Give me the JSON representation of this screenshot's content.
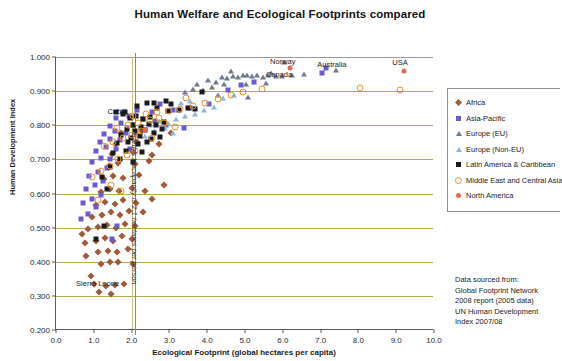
{
  "chart_data": {
    "type": "scatter",
    "title": "Human Welfare and Ecological Footprints compared",
    "xlabel": "Ecological Footprint (global hectares per capita)",
    "ylabel": "Human Development Index",
    "xlim": [
      0.0,
      10.0
    ],
    "ylim": [
      0.2,
      1.0
    ],
    "xticks": [
      "0.0",
      "1.0",
      "2.0",
      "3.0",
      "4.0",
      "5.0",
      "6.0",
      "7.0",
      "8.0",
      "9.0",
      "10.0"
    ],
    "yticks": [
      "0.200",
      "0.300",
      "0.400",
      "0.500",
      "0.600",
      "0.700",
      "0.800",
      "0.900",
      "1.000"
    ],
    "grid": "horizontal",
    "legend_position": "right",
    "annotations": [
      {
        "text": "Cuba",
        "x": 1.6,
        "y": 0.838
      },
      {
        "text": "Norway",
        "x": 6.0,
        "y": 0.985
      },
      {
        "text": "Canada",
        "x": 5.9,
        "y": 0.948
      },
      {
        "text": "Australia",
        "x": 7.3,
        "y": 0.977
      },
      {
        "text": "USA",
        "x": 9.1,
        "y": 0.982
      },
      {
        "text": "Sierra Leone",
        "x": 1.1,
        "y": 0.335
      },
      {
        "text": "Earth's biocapacity is 2.1 hectares per person",
        "x": 2.1,
        "y": 0.77,
        "rotated": true
      }
    ],
    "reference_lines": [
      {
        "axis": "x",
        "value": 2.1,
        "color": "#e06666",
        "label": "Earth's biocapacity is 2.1 hectares per person"
      }
    ],
    "series": [
      {
        "name": "Africa",
        "marker": "diamond",
        "color": "#9e5b3a",
        "points": [
          [
            1.0,
            0.336
          ],
          [
            1.32,
            0.33
          ],
          [
            1.55,
            0.332
          ],
          [
            1.8,
            0.334
          ],
          [
            0.92,
            0.358
          ],
          [
            1.2,
            0.392
          ],
          [
            1.42,
            0.398
          ],
          [
            1.65,
            0.4
          ],
          [
            2.05,
            0.392
          ],
          [
            0.8,
            0.418
          ],
          [
            1.1,
            0.43
          ],
          [
            1.38,
            0.432
          ],
          [
            1.62,
            0.428
          ],
          [
            1.9,
            0.436
          ],
          [
            0.78,
            0.455
          ],
          [
            1.05,
            0.462
          ],
          [
            1.3,
            0.47
          ],
          [
            1.52,
            0.462
          ],
          [
            1.75,
            0.474
          ],
          [
            2.0,
            0.466
          ],
          [
            0.85,
            0.495
          ],
          [
            1.12,
            0.502
          ],
          [
            1.35,
            0.508
          ],
          [
            1.58,
            0.5
          ],
          [
            1.82,
            0.512
          ],
          [
            2.08,
            0.505
          ],
          [
            0.95,
            0.53
          ],
          [
            1.22,
            0.538
          ],
          [
            1.45,
            0.545
          ],
          [
            1.68,
            0.536
          ],
          [
            1.92,
            0.548
          ],
          [
            1.05,
            0.566
          ],
          [
            1.3,
            0.574
          ],
          [
            1.55,
            0.568
          ],
          [
            1.78,
            0.58
          ],
          [
            2.12,
            0.572
          ],
          [
            1.18,
            0.604
          ],
          [
            1.42,
            0.612
          ],
          [
            1.66,
            0.606
          ],
          [
            2.02,
            0.616
          ],
          [
            2.35,
            0.608
          ],
          [
            1.28,
            0.642
          ],
          [
            1.52,
            0.65
          ],
          [
            1.76,
            0.644
          ],
          [
            2.2,
            0.655
          ],
          [
            1.4,
            0.682
          ],
          [
            1.64,
            0.69
          ],
          [
            2.1,
            0.686
          ],
          [
            2.45,
            0.694
          ],
          [
            1.48,
            0.716
          ],
          [
            2.05,
            0.722
          ],
          [
            2.55,
            0.712
          ],
          [
            1.6,
            0.745
          ],
          [
            2.15,
            0.752
          ],
          [
            2.72,
            0.744
          ],
          [
            1.72,
            0.778
          ],
          [
            2.28,
            0.784
          ],
          [
            3.05,
            0.776
          ],
          [
            1.15,
            0.312
          ],
          [
            1.45,
            0.305
          ],
          [
            0.7,
            0.48
          ],
          [
            2.3,
            0.545
          ],
          [
            2.55,
            0.585
          ],
          [
            2.85,
            0.625
          ]
        ]
      },
      {
        "name": "Asia-Pacific",
        "marker": "square",
        "color": "#6a5acd",
        "points": [
          [
            0.65,
            0.525
          ],
          [
            0.85,
            0.54
          ],
          [
            1.05,
            0.56
          ],
          [
            0.72,
            0.572
          ],
          [
            0.95,
            0.584
          ],
          [
            1.18,
            0.596
          ],
          [
            0.8,
            0.612
          ],
          [
            1.02,
            0.624
          ],
          [
            1.25,
            0.636
          ],
          [
            0.88,
            0.652
          ],
          [
            1.1,
            0.664
          ],
          [
            1.35,
            0.676
          ],
          [
            0.96,
            0.692
          ],
          [
            1.2,
            0.704
          ],
          [
            1.44,
            0.702
          ],
          [
            1.05,
            0.726
          ],
          [
            1.32,
            0.736
          ],
          [
            1.58,
            0.73
          ],
          [
            1.16,
            0.752
          ],
          [
            1.42,
            0.76
          ],
          [
            1.7,
            0.756
          ],
          [
            1.28,
            0.774
          ],
          [
            1.55,
            0.782
          ],
          [
            1.85,
            0.778
          ],
          [
            1.42,
            0.798
          ],
          [
            1.72,
            0.806
          ],
          [
            2.05,
            0.8
          ],
          [
            1.6,
            0.82
          ],
          [
            1.92,
            0.826
          ],
          [
            2.3,
            0.818
          ],
          [
            2.62,
            0.812
          ],
          [
            1.78,
            0.84
          ],
          [
            2.15,
            0.846
          ],
          [
            2.55,
            0.838
          ],
          [
            3.1,
            0.844
          ],
          [
            3.55,
            0.852
          ],
          [
            4.05,
            0.862
          ],
          [
            4.55,
            0.902
          ],
          [
            4.9,
            0.918
          ],
          [
            5.25,
            0.928
          ],
          [
            7.05,
            0.952
          ],
          [
            7.15,
            0.968
          ],
          [
            2.92,
            0.8
          ],
          [
            3.38,
            0.792
          ],
          [
            1.48,
            0.468
          ],
          [
            1.62,
            0.505
          ],
          [
            2.75,
            0.862
          ],
          [
            1.95,
            0.73
          ]
        ]
      },
      {
        "name": "Europe (EU)",
        "marker": "triangle",
        "color": "#6e7b8b",
        "points": [
          [
            3.62,
            0.905
          ],
          [
            3.88,
            0.902
          ],
          [
            4.02,
            0.932
          ],
          [
            4.22,
            0.928
          ],
          [
            4.38,
            0.94
          ],
          [
            4.52,
            0.938
          ],
          [
            4.68,
            0.944
          ],
          [
            4.82,
            0.942
          ],
          [
            4.95,
            0.946
          ],
          [
            5.05,
            0.948
          ],
          [
            5.18,
            0.945
          ],
          [
            5.32,
            0.948
          ],
          [
            5.48,
            0.942
          ],
          [
            5.62,
            0.946
          ],
          [
            5.82,
            0.944
          ],
          [
            5.98,
            0.944
          ],
          [
            6.25,
            0.946
          ],
          [
            6.55,
            0.95
          ],
          [
            3.42,
            0.896
          ],
          [
            3.72,
            0.922
          ],
          [
            4.12,
            0.912
          ],
          [
            4.45,
            0.92
          ],
          [
            5.02,
            0.922
          ],
          [
            5.55,
            0.924
          ],
          [
            4.28,
            0.89
          ],
          [
            5.08,
            0.884
          ],
          [
            6.02,
            0.985
          ],
          [
            7.4,
            0.962
          ],
          [
            4.62,
            0.958
          ],
          [
            5.7,
            0.952
          ]
        ]
      },
      {
        "name": "Europe (Non-EU)",
        "marker": "triangle",
        "color": "#8fb8d8",
        "points": [
          [
            2.48,
            0.802
          ],
          [
            2.72,
            0.812
          ],
          [
            2.95,
            0.808
          ],
          [
            3.18,
            0.818
          ],
          [
            3.42,
            0.826
          ],
          [
            3.68,
            0.832
          ],
          [
            3.92,
            0.846
          ],
          [
            4.18,
            0.854
          ],
          [
            2.6,
            0.782
          ],
          [
            2.88,
            0.792
          ],
          [
            3.3,
            0.864
          ],
          [
            3.55,
            0.872
          ],
          [
            3.1,
            0.778
          ],
          [
            4.42,
            0.88
          ],
          [
            4.72,
            0.888
          ],
          [
            2.35,
            0.768
          ]
        ]
      },
      {
        "name": "Latin America & Caribbean",
        "marker": "square",
        "color": "#1a1a1a",
        "points": [
          [
            1.58,
            0.838
          ],
          [
            1.78,
            0.832
          ],
          [
            1.95,
            0.822
          ],
          [
            2.12,
            0.828
          ],
          [
            2.3,
            0.818
          ],
          [
            2.48,
            0.824
          ],
          [
            2.05,
            0.8
          ],
          [
            2.25,
            0.796
          ],
          [
            2.45,
            0.804
          ],
          [
            2.65,
            0.8
          ],
          [
            2.85,
            0.81
          ],
          [
            1.88,
            0.79
          ],
          [
            2.1,
            0.782
          ],
          [
            2.35,
            0.786
          ],
          [
            2.58,
            0.778
          ],
          [
            2.8,
            0.788
          ],
          [
            1.72,
            0.77
          ],
          [
            1.98,
            0.762
          ],
          [
            2.22,
            0.768
          ],
          [
            2.52,
            0.76
          ],
          [
            2.75,
            0.766
          ],
          [
            1.62,
            0.748
          ],
          [
            1.9,
            0.752
          ],
          [
            2.18,
            0.744
          ],
          [
            2.42,
            0.75
          ],
          [
            1.52,
            0.72
          ],
          [
            1.85,
            0.726
          ],
          [
            2.28,
            0.722
          ],
          [
            1.68,
            0.7
          ],
          [
            2.05,
            0.692
          ],
          [
            1.42,
            0.678
          ],
          [
            1.22,
            0.648
          ],
          [
            1.82,
            0.838
          ],
          [
            2.95,
            0.842
          ],
          [
            3.25,
            0.846
          ],
          [
            3.5,
            0.852
          ],
          [
            2.68,
            0.852
          ],
          [
            3.05,
            0.862
          ],
          [
            1.35,
            0.612
          ],
          [
            3.68,
            0.848
          ],
          [
            2.9,
            0.872
          ],
          [
            2.6,
            0.866
          ],
          [
            1.28,
            0.505
          ],
          [
            1.05,
            0.466
          ],
          [
            3.85,
            0.898
          ],
          [
            2.15,
            0.855
          ],
          [
            2.4,
            0.864
          ]
        ]
      },
      {
        "name": "Middle East and Central Asia",
        "marker": "circle-open",
        "color": "#e8902a",
        "points": [
          [
            0.95,
            0.648
          ],
          [
            1.18,
            0.666
          ],
          [
            1.42,
            0.682
          ],
          [
            1.65,
            0.7
          ],
          [
            1.88,
            0.712
          ],
          [
            2.08,
            0.726
          ],
          [
            1.28,
            0.74
          ],
          [
            1.52,
            0.752
          ],
          [
            1.78,
            0.762
          ],
          [
            2.02,
            0.772
          ],
          [
            2.25,
            0.782
          ],
          [
            1.62,
            0.792
          ],
          [
            1.9,
            0.8
          ],
          [
            2.18,
            0.808
          ],
          [
            2.48,
            0.814
          ],
          [
            2.72,
            0.82
          ],
          [
            2.05,
            0.828
          ],
          [
            2.38,
            0.834
          ],
          [
            2.68,
            0.838
          ],
          [
            2.98,
            0.842
          ],
          [
            3.28,
            0.848
          ],
          [
            3.62,
            0.856
          ],
          [
            3.95,
            0.866
          ],
          [
            4.28,
            0.876
          ],
          [
            4.62,
            0.888
          ],
          [
            4.95,
            0.896
          ],
          [
            2.85,
            0.806
          ],
          [
            3.15,
            0.796
          ],
          [
            1.45,
            0.626
          ],
          [
            1.72,
            0.608
          ],
          [
            8.05,
            0.908
          ],
          [
            9.1,
            0.902
          ],
          [
            5.45,
            0.906
          ],
          [
            2.55,
            0.762
          ],
          [
            3.45,
            0.88
          ],
          [
            1.1,
            0.582
          ]
        ]
      },
      {
        "name": "North America",
        "marker": "circle-filled",
        "color": "#e8675a",
        "points": [
          [
            6.2,
            0.968
          ],
          [
            9.2,
            0.958
          ],
          [
            2.35,
            0.786
          ]
        ]
      }
    ]
  },
  "legend": {
    "items": [
      {
        "label": "Africa",
        "marker": "diamond",
        "color": "#9e5b3a"
      },
      {
        "label": "Asia-Pacific",
        "marker": "square",
        "color": "#6a5acd"
      },
      {
        "label": "Europe (EU)",
        "marker": "triangle",
        "color": "#6e7b8b"
      },
      {
        "label": "Europe (Non-EU)",
        "marker": "triangle",
        "color": "#8fb8d8"
      },
      {
        "label": "Latin America & Caribbean",
        "marker": "square",
        "color": "#1a1a1a"
      },
      {
        "label": "Middle East and Central Asia",
        "marker": "circle-open",
        "color": "#e8902a"
      },
      {
        "label": "North America",
        "marker": "circle-filled",
        "color": "#e8675a"
      }
    ]
  },
  "source_note": {
    "lines": [
      "Data sourced from:",
      "Global Footprint Network",
      "2008 report (2005 data)",
      "UN Human Development",
      "Index 2007/08"
    ]
  }
}
